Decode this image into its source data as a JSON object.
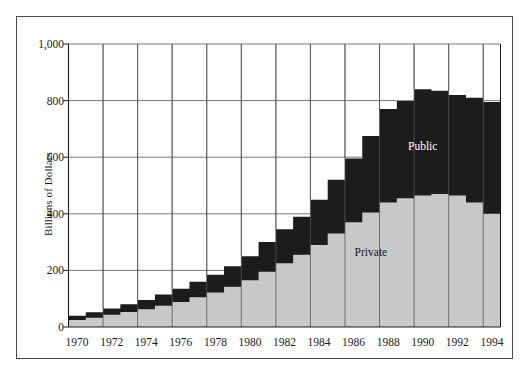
{
  "chart_data": {
    "type": "area",
    "title": "",
    "subtitle": "",
    "xlabel": "",
    "ylabel": "Billions of Dollars",
    "ylim": [
      0,
      1000
    ],
    "xlim": [
      1970,
      1995
    ],
    "grid": true,
    "grid_vertical_every": 2,
    "legend_position": "inline-annotations",
    "stacked": true,
    "step": true,
    "y_ticks": [
      "0",
      "200",
      "400",
      "600",
      "800",
      "1,000"
    ],
    "y_tick_values": [
      0,
      200,
      400,
      600,
      800,
      1000
    ],
    "x_ticks": [
      "1970",
      "1972",
      "1974",
      "1976",
      "1978",
      "1980",
      "1982",
      "1984",
      "1986",
      "1988",
      "1990",
      "1992",
      "1994"
    ],
    "x_tick_values": [
      1970,
      1972,
      1974,
      1976,
      1978,
      1980,
      1982,
      1984,
      1986,
      1988,
      1990,
      1992,
      1994
    ],
    "x": [
      1970,
      1971,
      1972,
      1973,
      1974,
      1975,
      1976,
      1977,
      1978,
      1979,
      1980,
      1981,
      1982,
      1983,
      1984,
      1985,
      1986,
      1987,
      1988,
      1989,
      1990,
      1991,
      1992,
      1993,
      1994
    ],
    "categories": [
      1970,
      1971,
      1972,
      1973,
      1974,
      1975,
      1976,
      1977,
      1978,
      1979,
      1980,
      1981,
      1982,
      1983,
      1984,
      1985,
      1986,
      1987,
      1988,
      1989,
      1990,
      1991,
      1992,
      1993,
      1994
    ],
    "series": [
      {
        "name": "Private",
        "color": "#c8c8c8",
        "values": [
          25,
          33,
          43,
          53,
          63,
          75,
          88,
          105,
          122,
          142,
          165,
          195,
          225,
          255,
          290,
          330,
          370,
          405,
          440,
          455,
          465,
          470,
          465,
          440,
          400
        ]
      },
      {
        "name": "Public",
        "color": "#1c1c1c",
        "values": [
          15,
          19,
          22,
          27,
          32,
          40,
          47,
          55,
          63,
          73,
          85,
          105,
          120,
          135,
          160,
          190,
          225,
          270,
          330,
          345,
          375,
          365,
          355,
          370,
          395
        ]
      }
    ],
    "totals": [
      40,
      52,
      65,
      80,
      95,
      115,
      135,
      160,
      185,
      215,
      250,
      300,
      345,
      390,
      450,
      520,
      595,
      675,
      770,
      800,
      840,
      835,
      820,
      810,
      795
    ],
    "annotations": [
      {
        "text": "Public",
        "x": 1990,
        "y": 640
      },
      {
        "text": "Private",
        "x": 1987,
        "y": 265
      }
    ],
    "colors": {
      "private": "#c8c8c8",
      "public": "#1c1c1c",
      "grid": "#555555",
      "axis": "#1a1a1a",
      "frame": "#4a4a4a",
      "background": "#ffffff"
    }
  }
}
